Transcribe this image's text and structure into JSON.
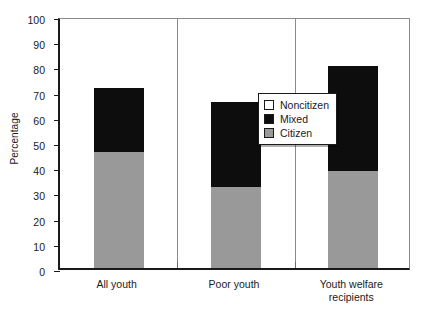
{
  "chart_data": {
    "type": "bar",
    "subtype": "stacked",
    "title": "",
    "xlabel": "",
    "ylabel": "Percentage",
    "ylim": [
      0,
      100
    ],
    "ytick_step": 10,
    "yticks": [
      0,
      10,
      20,
      30,
      40,
      50,
      60,
      70,
      80,
      90,
      100
    ],
    "grid": false,
    "legend_position": "inside-center-upper",
    "categories": [
      "All youth",
      "Poor youth",
      "Youth welfare recipients"
    ],
    "category_label_lines": [
      [
        "All youth"
      ],
      [
        "Poor youth"
      ],
      [
        "Youth welfare",
        "recipients"
      ]
    ],
    "series": [
      {
        "name": "Citizen",
        "color": "#999999",
        "values": [
          46.0,
          32.0,
          38.5
        ]
      },
      {
        "name": "Mixed",
        "color": "#0d0d0d",
        "values": [
          25.5,
          34.0,
          41.5
        ]
      },
      {
        "name": "Noncitizen",
        "color": "#ffffff",
        "values": [
          28.5,
          34.0,
          20.0
        ]
      }
    ],
    "stack_tops": {
      "citizen": [
        46.0,
        32.0,
        38.5
      ],
      "citizen_plus_mixed": [
        71.5,
        66.0,
        80.0
      ]
    },
    "legend_entries": [
      {
        "label": "Noncitizen",
        "color": "#ffffff"
      },
      {
        "label": "Mixed",
        "color": "#0d0d0d"
      },
      {
        "label": "Citizen",
        "color": "#999999"
      }
    ]
  },
  "axis": {
    "y_title": "Percentage",
    "y_tick_labels": [
      "100",
      "90",
      "80",
      "70",
      "60",
      "50",
      "40",
      "30",
      "20",
      "10",
      "0"
    ]
  }
}
